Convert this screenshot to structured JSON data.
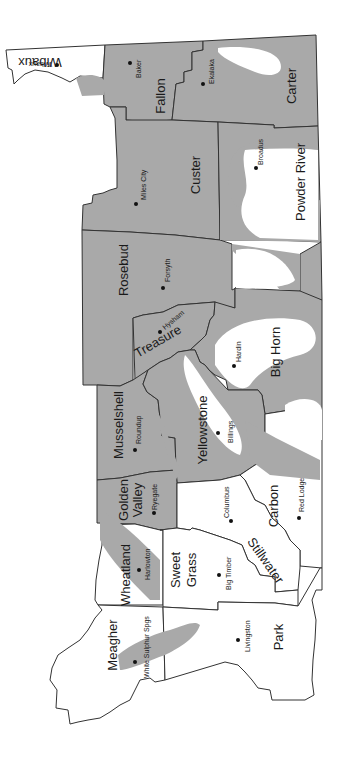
{
  "map": {
    "orientation": "rotated 90 degrees counter-clockwise",
    "shade_color": "#a9a9a9",
    "border_color": "#333333",
    "counties": [
      {
        "name": "Wibaux",
        "town": "Wibaux"
      },
      {
        "name": "Fallon",
        "town": "Baker"
      },
      {
        "name": "Carter",
        "town": "Ekalaka"
      },
      {
        "name": "Custer",
        "town": "Miles City"
      },
      {
        "name": "Powder River",
        "town": "Broadus"
      },
      {
        "name": "Rosebud",
        "town": "Forsyth"
      },
      {
        "name": "Treasure",
        "town": "Hysham"
      },
      {
        "name": "Big Horn",
        "town": "Hardin"
      },
      {
        "name": "Musselshell",
        "town": "Roundup"
      },
      {
        "name": "Yellowstone",
        "town": "Billings"
      },
      {
        "name": "Golden Valley",
        "town": "Ryegate"
      },
      {
        "name": "Carbon",
        "town": "Red Lodge"
      },
      {
        "name": "Stillwater",
        "town": "Columbus"
      },
      {
        "name": "Wheatland",
        "town": "Harlowton"
      },
      {
        "name": "Sweet Grass",
        "town": "Big Timber"
      },
      {
        "name": "Meagher",
        "town": "White Sulphur Spgs"
      },
      {
        "name": "Park",
        "town": "Livingston"
      }
    ],
    "labels": {
      "wibaux": "Wibaux",
      "wibaux_town": "Wibaux",
      "fallon": "Fallon",
      "baker": "Baker",
      "carter": "Carter",
      "ekalaka": "Ekalaka",
      "custer": "Custer",
      "miles_city": "Miles City",
      "powder_river": "Powder River",
      "broadus": "Broadus",
      "rosebud": "Rosebud",
      "forsyth": "Forsyth",
      "treasure": "Treasure",
      "hysham": "Hysham",
      "big_horn": "Big Horn",
      "hardin": "Hardin",
      "musselshell": "Musselshell",
      "roundup": "Roundup",
      "yellowstone": "Yellowstone",
      "billings": "Billings",
      "golden": "Golden",
      "valley": "Valley",
      "ryegate": "Ryegate",
      "carbon": "Carbon",
      "red_lodge": "Red Lodge",
      "stillwater": "Stillwater",
      "columbus": "Columbus",
      "wheatland": "Wheatland",
      "harlowton": "Harlowton",
      "sweet": "Sweet",
      "grass": "Grass",
      "big_timber": "Big Timber",
      "meagher": "Meagher",
      "white_sulphur": "White Sulphur Spgs",
      "park": "Park",
      "livingston": "Livingston"
    }
  }
}
